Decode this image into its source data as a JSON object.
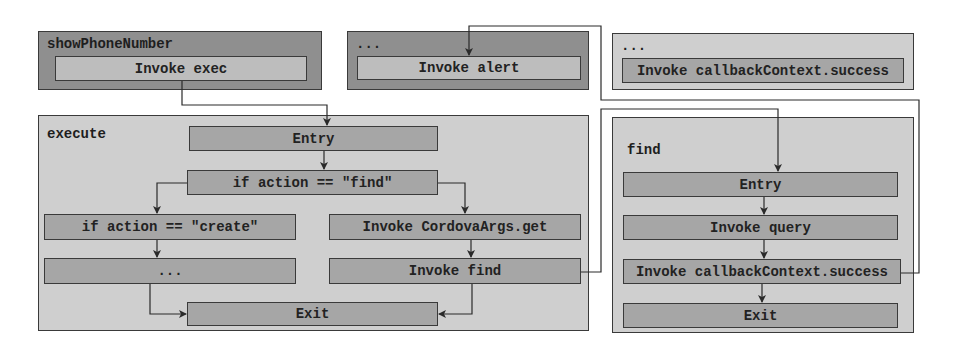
{
  "diagram": {
    "groups": {
      "showPhoneNumber": {
        "title": "showPhoneNumber",
        "nodes": [
          "Invoke exec"
        ]
      },
      "caller_alert": {
        "title": "...",
        "nodes": [
          "Invoke alert"
        ]
      },
      "caller_success": {
        "title": "...",
        "nodes": [
          "Invoke callbackContext.success"
        ]
      },
      "execute": {
        "title": "execute",
        "nodes": {
          "entry": "Entry",
          "if_find": "if action == \"find\"",
          "if_create": "if action == \"create\"",
          "ellipsis": "...",
          "cordova_get": "Invoke CordovaArgs.get",
          "invoke_find": "Invoke find",
          "exit": "Exit"
        }
      },
      "find": {
        "title": "find",
        "nodes": {
          "entry": "Entry",
          "invoke_query": "Invoke query",
          "invoke_success": "Invoke callbackContext.success",
          "exit": "Exit"
        }
      }
    },
    "edges": [
      {
        "from": "Invoke exec",
        "to": "execute.Entry"
      },
      {
        "from": "execute.Entry",
        "to": "if action == \"find\""
      },
      {
        "from": "if action == \"find\"",
        "to": "if action == \"create\""
      },
      {
        "from": "if action == \"find\"",
        "to": "Invoke CordovaArgs.get"
      },
      {
        "from": "if action == \"create\"",
        "to": "..."
      },
      {
        "from": "...",
        "to": "execute.Exit"
      },
      {
        "from": "Invoke CordovaArgs.get",
        "to": "Invoke find"
      },
      {
        "from": "Invoke find",
        "to": "execute.Exit"
      },
      {
        "from": "Invoke find",
        "to": "find.Entry"
      },
      {
        "from": "find.Entry",
        "to": "Invoke query"
      },
      {
        "from": "Invoke query",
        "to": "find.Invoke callbackContext.success"
      },
      {
        "from": "find.Invoke callbackContext.success",
        "to": "find.Exit"
      },
      {
        "from": "find.Invoke callbackContext.success",
        "to": "Invoke alert"
      }
    ],
    "colors": {
      "dark_group": "#8f8f8f",
      "light_group": "#cfcfcf",
      "node_mid": "#a6a6a6",
      "node_pale": "#bdbdbd",
      "border": "#3a3a3a"
    }
  }
}
